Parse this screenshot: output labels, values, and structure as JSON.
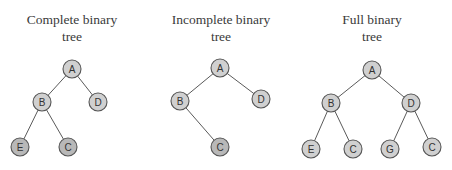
{
  "colors": {
    "node_fill": "#d0d0d0",
    "node_fill_leaf": "#b8b8b8",
    "node_stroke": "#555555",
    "edge": "#5a5a5a",
    "text": "#3a3a3a"
  },
  "diagrams": [
    {
      "id": "complete",
      "title_line1": "Complete binary",
      "title_line2": "tree",
      "title_x": 2,
      "nodes": [
        {
          "label": "A",
          "x": 72,
          "y": 69,
          "leaf": false
        },
        {
          "label": "B",
          "x": 42,
          "y": 102,
          "leaf": false
        },
        {
          "label": "D",
          "x": 98,
          "y": 102,
          "leaf": false
        },
        {
          "label": "E",
          "x": 20,
          "y": 147,
          "leaf": true
        },
        {
          "label": "C",
          "x": 68,
          "y": 147,
          "leaf": true
        }
      ],
      "edges": [
        [
          0,
          1
        ],
        [
          0,
          2
        ],
        [
          1,
          3
        ],
        [
          1,
          4
        ]
      ]
    },
    {
      "id": "incomplete",
      "title_line1": "Incomplete binary",
      "title_line2": "tree",
      "title_x": 151,
      "nodes": [
        {
          "label": "A",
          "x": 220,
          "y": 68,
          "leaf": false
        },
        {
          "label": "B",
          "x": 180,
          "y": 101,
          "leaf": false
        },
        {
          "label": "D",
          "x": 261,
          "y": 99,
          "leaf": false
        },
        {
          "label": "C",
          "x": 220,
          "y": 147,
          "leaf": true
        }
      ],
      "edges": [
        [
          0,
          1
        ],
        [
          0,
          2
        ],
        [
          1,
          3
        ]
      ]
    },
    {
      "id": "full",
      "title_line1": "Full binary",
      "title_line2": "tree",
      "title_x": 302,
      "nodes": [
        {
          "label": "A",
          "x": 372,
          "y": 70,
          "leaf": false
        },
        {
          "label": "B",
          "x": 331,
          "y": 103,
          "leaf": false
        },
        {
          "label": "D",
          "x": 411,
          "y": 103,
          "leaf": false
        },
        {
          "label": "E",
          "x": 311,
          "y": 149,
          "leaf": false
        },
        {
          "label": "C",
          "x": 353,
          "y": 149,
          "leaf": false
        },
        {
          "label": "G",
          "x": 390,
          "y": 149,
          "leaf": false
        },
        {
          "label": "C",
          "x": 432,
          "y": 147,
          "leaf": false
        }
      ],
      "edges": [
        [
          0,
          1
        ],
        [
          0,
          2
        ],
        [
          1,
          3
        ],
        [
          1,
          4
        ],
        [
          2,
          5
        ],
        [
          2,
          6
        ]
      ]
    }
  ]
}
